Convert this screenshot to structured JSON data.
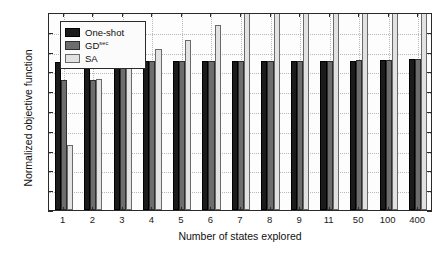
{
  "chart_data": {
    "type": "bar",
    "title": "",
    "xlabel": "Number of states explored",
    "ylabel": "Normalized objective function",
    "categories": [
      "1",
      "2",
      "3",
      "4",
      "5",
      "6",
      "7",
      "8",
      "9",
      "11",
      "50",
      "100",
      "400"
    ],
    "ylim": [
      0,
      1
    ],
    "ytick_labels": [
      "0",
      "0.1",
      "0.2",
      "0.3",
      "0.4",
      "0.5",
      "0.6",
      "0.7",
      "0.8",
      "0.9",
      "1"
    ],
    "ytick_values": [
      0,
      0.1,
      0.2,
      0.3,
      0.4,
      0.5,
      0.6,
      0.7,
      0.8,
      0.9,
      1
    ],
    "grid": true,
    "legend_position": "upper left",
    "series": [
      {
        "name": "One-shot",
        "color": "#1b1b1b",
        "values": [
          0.75,
          0.75,
          0.752,
          0.752,
          0.752,
          0.752,
          0.752,
          0.752,
          0.752,
          0.752,
          0.755,
          0.757,
          0.762
        ]
      },
      {
        "name": "GD",
        "name_superscript": "sec",
        "color": "#6d6d6d",
        "values": [
          0.655,
          0.655,
          0.753,
          0.753,
          0.753,
          0.753,
          0.753,
          0.753,
          0.753,
          0.755,
          0.757,
          0.76,
          0.765
        ]
      },
      {
        "name": "SA",
        "color": "#e2e2e2",
        "values": [
          0.33,
          0.66,
          0.81,
          0.815,
          0.86,
          0.935,
          1.0,
          1.0,
          1.0,
          1.0,
          1.0,
          1.0,
          1.0
        ]
      }
    ]
  }
}
